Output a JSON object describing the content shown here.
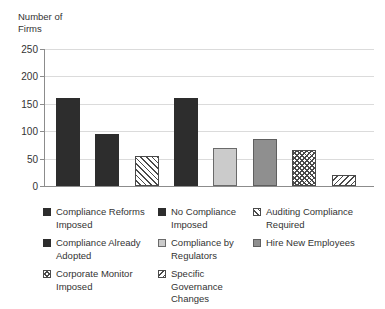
{
  "chart_data": {
    "type": "bar",
    "title": "",
    "ylabel": "Number of Firms",
    "xlabel": "",
    "ylim": [
      0,
      250
    ],
    "yticks": [
      0,
      50,
      100,
      150,
      200,
      250
    ],
    "grid": true,
    "legend_position": "bottom",
    "series": [
      {
        "label": "Compliance Reforms Imposed",
        "value": 160,
        "pattern": "solid-dark"
      },
      {
        "label": "No Compliance Imposed",
        "value": 95,
        "pattern": "solid-dark"
      },
      {
        "label": "Auditing Compliance Required",
        "value": 55,
        "pattern": "hatch-down"
      },
      {
        "label": "Compliance Already Adopted",
        "value": 160,
        "pattern": "solid-dark"
      },
      {
        "label": "Compliance by Regulators",
        "value": 70,
        "pattern": "solid-light"
      },
      {
        "label": "Hire New Employees",
        "value": 85,
        "pattern": "solid-medium"
      },
      {
        "label": "Corporate Monitor Imposed",
        "value": 65,
        "pattern": "crosshatch"
      },
      {
        "label": "Specific Governance Changes",
        "value": 20,
        "pattern": "hatch-up"
      }
    ],
    "colors": {
      "bar_dark": "#2d2d2d",
      "bar_light_gray": "#cbcbcb",
      "bar_medium_gray": "#8f8f8f",
      "hatch_stroke": "#4a4a4a",
      "gridline": "#dbdbdb",
      "axis": "#8c8c8c",
      "text": "#333333",
      "background": "#ffffff"
    }
  }
}
